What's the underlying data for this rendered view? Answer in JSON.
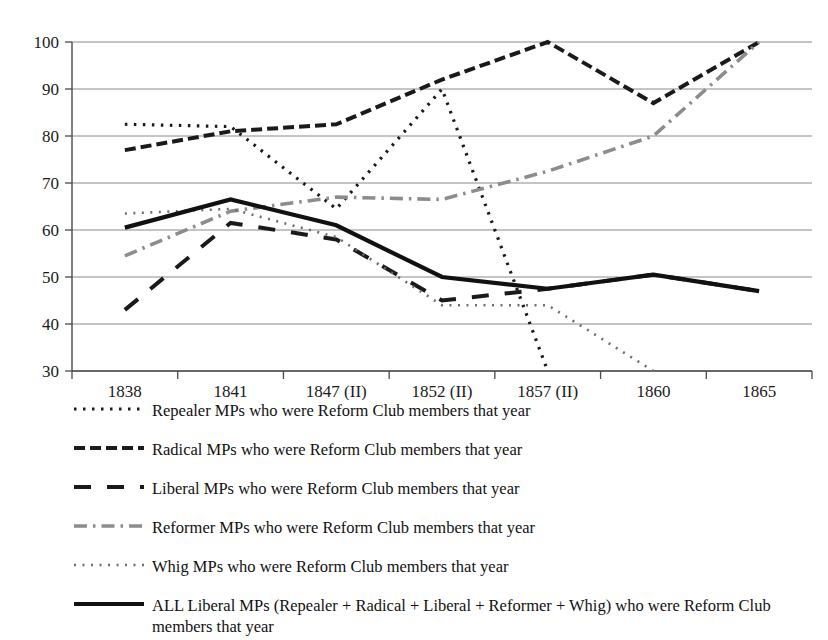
{
  "chart_data": {
    "type": "line",
    "title": "",
    "xlabel": "",
    "ylabel": "",
    "categories": [
      "1838",
      "1841",
      "1847 (II)",
      "1852 (II)",
      "1857 (II)",
      "1860",
      "1865"
    ],
    "ylim": [
      30,
      100
    ],
    "yticks": [
      30,
      40,
      50,
      60,
      70,
      80,
      90,
      100
    ],
    "grid": true,
    "legend_position": "below",
    "series": [
      {
        "name": "Repealer MPs who were Reform Club members that year",
        "style": "dotted",
        "color": "#1a1a1a",
        "values": [
          82.5,
          82,
          64.5,
          90,
          30,
          null,
          null
        ],
        "note": "falls off the bottom of the chart between 1852 (II) and 1857 (II)"
      },
      {
        "name": "Radical MPs who were Reform Club members that year",
        "style": "dashed",
        "color": "#1a1a1a",
        "values": [
          77,
          81,
          82.5,
          92,
          100,
          87,
          100
        ]
      },
      {
        "name": "Liberal MPs who were Reform Club members that year",
        "style": "long-dashed",
        "color": "#1a1a1a",
        "values": [
          43,
          61.5,
          58,
          45,
          47.5,
          50.5,
          47
        ]
      },
      {
        "name": "Reformer MPs who were Reform Club members that year",
        "style": "dash-dot",
        "color": "#8c8c8c",
        "values": [
          54.5,
          64,
          67,
          66.5,
          72.5,
          80,
          100
        ]
      },
      {
        "name": "Whig MPs who were Reform Club members that year",
        "style": "fine-dotted",
        "color": "#6e6e6e",
        "values": [
          63.5,
          64.5,
          58.5,
          44,
          44,
          30,
          null
        ],
        "note": "falls off the bottom of the chart between 1857 (II) and 1860"
      },
      {
        "name": "ALL Liberal MPs (Repealer + Radical + Liberal + Reformer + Whig) who were Reform Club members that year",
        "style": "solid",
        "color": "#111111",
        "values": [
          60.5,
          66.5,
          61,
          50,
          47.5,
          50.5,
          47
        ]
      }
    ]
  },
  "legend": {
    "items": [
      {
        "label": "Repealer MPs who were Reform Club members that year"
      },
      {
        "label": "Radical MPs who were Reform Club members that year"
      },
      {
        "label": "Liberal MPs who were Reform Club members that year"
      },
      {
        "label": "Reformer MPs who were Reform Club members that year"
      },
      {
        "label": "Whig MPs who were Reform Club members that year"
      },
      {
        "label": "ALL Liberal MPs (Repealer + Radical + Liberal + Reformer + Whig) who were Reform Club members that year"
      }
    ]
  }
}
